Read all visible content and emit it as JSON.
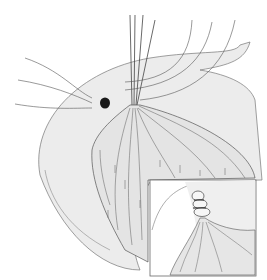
{
  "figure": {
    "colors": {
      "background": "#ffffff",
      "organ_fill": "#ececec",
      "organ_shadow": "#e0e0e0",
      "line": "#555555",
      "lesion": "#1a1a1a",
      "inset_border": "#666666"
    },
    "inset": {
      "label": "ligated-tissue-inset"
    }
  }
}
